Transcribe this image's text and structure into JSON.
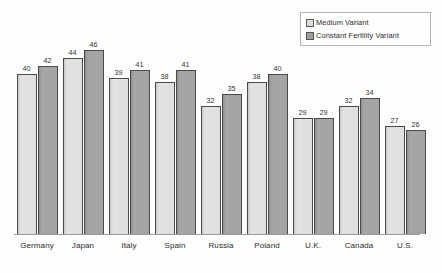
{
  "chart_data": {
    "type": "bar",
    "title": "",
    "subtitle": "",
    "xlabel": "",
    "ylabel": "",
    "grid": false,
    "legend_position": "top-right",
    "ylim": [
      0,
      50
    ],
    "categories": [
      "Germany",
      "Japan",
      "Italy",
      "Spain",
      "Russia",
      "Poland",
      "U.K.",
      "Canada",
      "U.S."
    ],
    "series": [
      {
        "name": "Medium Variant",
        "color": "#dedede",
        "values": [
          40,
          44,
          39,
          38,
          32,
          38,
          29,
          32,
          27
        ]
      },
      {
        "name": "Constant Fertility Variant",
        "color": "#a2a2a2",
        "values": [
          42,
          46,
          41,
          41,
          35,
          40,
          29,
          34,
          26
        ]
      }
    ],
    "value_labels_shown": true,
    "axis_line_color": "#9a9a9a",
    "bar_outline_color": "#4a4a4a"
  },
  "legend": {
    "items": [
      {
        "label": "Medium Variant",
        "swatch": "legend-swatch-medium"
      },
      {
        "label": "Constant Fertility Variant",
        "swatch": "legend-swatch-constant"
      }
    ]
  }
}
